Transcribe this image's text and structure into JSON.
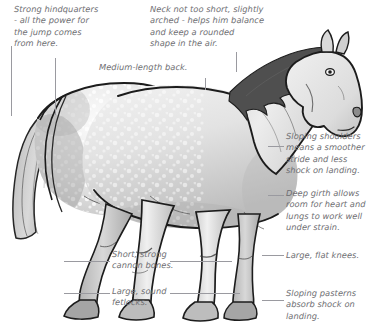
{
  "figure": {
    "background_color": "#ffffff",
    "text_color": "#6e6e72",
    "leader_color": "#9a9aa0",
    "outline_color": "#1e1e1e"
  },
  "annotations": {
    "hindquarters": "Strong hindquarters\n- all the power for\nthe jump comes\nfrom here.",
    "neck": "Neck not too short, slightly\narched - helps him balance\nand keep a rounded\nshape in the air.",
    "back": "Medium-length back.",
    "shoulders": "Sloping shoulders\nmeans a smoother\nstride and less\nshock on landing.",
    "girth": "Deep girth allows\nroom for heart and\nlungs to work well\nunder strain.",
    "cannon": "Short, strong\ncannon bones.",
    "fetlocks": "Large, sound\nfetlocks.",
    "knees": "Large, flat knees.",
    "pasterns": "Sloping pasterns\nabsorb shock on\nlanding."
  }
}
